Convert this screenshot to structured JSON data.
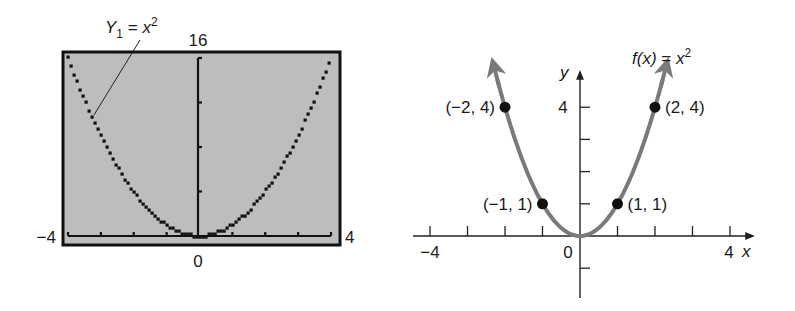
{
  "chart_data": [
    {
      "type": "line",
      "title": "Graphing calculator screen",
      "function_label": "Y₁ = x²",
      "function_label_parts": {
        "name": "Y",
        "sub": "1",
        "eq": " = ",
        "var": "x",
        "sup": "2"
      },
      "xlim": [
        -4,
        4
      ],
      "ylim": [
        0,
        16
      ],
      "x_tick_labels": {
        "min": "−4",
        "max": "4",
        "origin": "0"
      },
      "y_tick_labels": {
        "max": "16"
      },
      "x_ticks": [
        -4,
        -3,
        -2,
        -1,
        0,
        1,
        2,
        3,
        4
      ],
      "y_ticks": [
        0,
        4,
        8,
        12,
        16
      ],
      "background_color": "#bdbdbd",
      "curve_color": "#111111",
      "series": [
        {
          "name": "Y1 = x^2",
          "x": [
            -4,
            -3,
            -2,
            -1,
            0,
            1,
            2,
            3,
            4
          ],
          "y": [
            16,
            9,
            4,
            1,
            0,
            1,
            4,
            9,
            16
          ]
        }
      ]
    },
    {
      "type": "line",
      "title": "f(x) = x²",
      "function_label_parts": {
        "name": "f(x)",
        "eq": " = ",
        "var": "x",
        "sup": "2"
      },
      "xlabel": "x",
      "ylabel": "y",
      "xlim": [
        -4,
        4
      ],
      "ylim": [
        -1,
        4
      ],
      "x_tick_labels": {
        "min": "−4",
        "max": "4",
        "origin": "0"
      },
      "y_tick_labels": {
        "top": "4"
      },
      "x_ticks": [
        -4,
        -3,
        -2,
        -1,
        0,
        1,
        2,
        3,
        4
      ],
      "y_ticks": [
        -1,
        1,
        2,
        3,
        4
      ],
      "curve_color": "#7a7a7a",
      "points": [
        {
          "x": -2,
          "y": 4,
          "label": "(−2, 4)"
        },
        {
          "x": -1,
          "y": 1,
          "label": "(−1, 1)"
        },
        {
          "x": 1,
          "y": 1,
          "label": "(1, 1)"
        },
        {
          "x": 2,
          "y": 4,
          "label": "(2, 4)"
        }
      ],
      "series": [
        {
          "name": "f(x) = x^2",
          "x": [
            -2,
            -1,
            0,
            1,
            2
          ],
          "y": [
            4,
            1,
            0,
            1,
            4
          ]
        }
      ]
    }
  ]
}
